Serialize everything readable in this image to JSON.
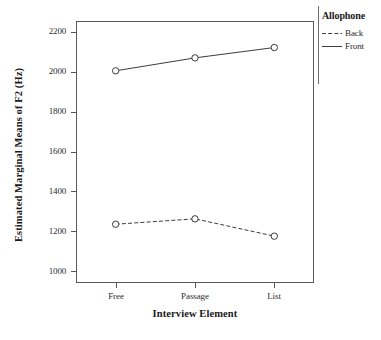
{
  "chart_data": {
    "type": "line",
    "title": "",
    "xlabel": "Interview Element",
    "ylabel": "Estimated Marginal Means of F2 (Hz)",
    "categories": [
      "Free",
      "Passage",
      "List"
    ],
    "series": [
      {
        "name": "Back",
        "style": "dashed",
        "values": [
          1235,
          1262,
          1175
        ]
      },
      {
        "name": "Front",
        "style": "solid",
        "values": [
          2005,
          2070,
          2122
        ]
      }
    ],
    "legend_title": "Allophone",
    "legend_position": "right",
    "ylim": [
      940,
      2255
    ],
    "yticks": [
      1000,
      1200,
      1400,
      1600,
      1800,
      2000,
      2200
    ],
    "ytick_labels": [
      "1000",
      "1200",
      "1400",
      "1600",
      "1800",
      "2000",
      "2200"
    ],
    "grid": false,
    "marker": "open-circle",
    "line_color": "#3c3c3c"
  },
  "axes": {
    "y_title": "Estimated Marginal Means of F2 (Hz)",
    "x_title": "Interview Element",
    "y_ticks": [
      "2200",
      "2000",
      "1800",
      "1600",
      "1400",
      "1200",
      "1000"
    ],
    "x_ticks": [
      "Free",
      "Passage",
      "List"
    ]
  },
  "legend": {
    "title": "Allophone",
    "items": [
      {
        "label": "Back",
        "style": "dashed"
      },
      {
        "label": "Front",
        "style": "solid"
      }
    ]
  },
  "caption": {
    "text": ""
  }
}
